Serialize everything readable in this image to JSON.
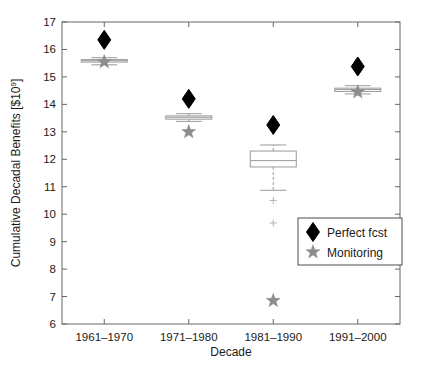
{
  "chart_data": {
    "type": "box",
    "title": "",
    "xlabel": "Decade",
    "ylabel": "Cumulative Decadal Benefits [$10",
    "ylabel_exponent": "9",
    "ylabel_suffix": "]",
    "categories": [
      "1961–1970",
      "1971–1980",
      "1981–1990",
      "1991–2000"
    ],
    "ylim": [
      6,
      17
    ],
    "xlim": [
      0.5,
      4.5
    ],
    "yticks": [
      6,
      7,
      8,
      9,
      10,
      11,
      12,
      13,
      14,
      15,
      16,
      17
    ],
    "ytick_labels": [
      "6",
      "7",
      "8",
      "9",
      "10",
      "11",
      "12",
      "13",
      "14",
      "15",
      "16",
      "17"
    ],
    "grid": false,
    "legend_position": "lower right",
    "legend": [
      {
        "label": "Perfect fcst",
        "marker": "diamond",
        "color": "#000000"
      },
      {
        "label": "Monitoring",
        "marker": "star",
        "color": "#8c8c8c"
      }
    ],
    "box_color": "#999999",
    "median_color": "#999999",
    "whisker_color": "#999999",
    "outlier_color": "#b3b3b3",
    "boxes": [
      {
        "category": "1961–1970",
        "whisker_low": 15.44,
        "q1": 15.54,
        "median": 15.59,
        "q3": 15.63,
        "whisker_high": 15.7,
        "outliers": []
      },
      {
        "category": "1971–1980",
        "whisker_low": 13.38,
        "q1": 13.46,
        "median": 13.53,
        "q3": 13.58,
        "whisker_high": 13.66,
        "outliers": []
      },
      {
        "category": "1981–1990",
        "whisker_low": 10.87,
        "q1": 11.72,
        "median": 11.95,
        "q3": 12.3,
        "whisker_high": 12.52,
        "outliers": [
          10.5,
          9.68
        ]
      },
      {
        "category": "1991–2000",
        "whisker_low": 14.38,
        "q1": 14.47,
        "median": 14.54,
        "q3": 14.59,
        "whisker_high": 14.68,
        "outliers": []
      }
    ],
    "series": [
      {
        "name": "Perfect fcst",
        "marker": "diamond",
        "color": "#000000",
        "x": [
          "1961–1970",
          "1971–1980",
          "1981–1990",
          "1991–2000"
        ],
        "values": [
          16.35,
          14.2,
          13.25,
          15.38
        ]
      },
      {
        "name": "Monitoring",
        "marker": "star",
        "color": "#8c8c8c",
        "x": [
          "1961–1970",
          "1971–1980",
          "1981–1990",
          "1991–2000"
        ],
        "values": [
          15.55,
          13.0,
          6.85,
          14.45
        ]
      }
    ]
  }
}
